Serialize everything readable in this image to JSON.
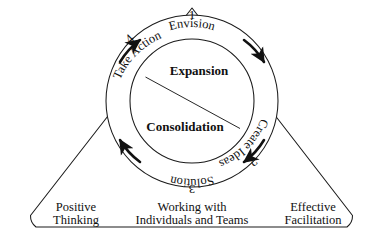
{
  "diagram": {
    "type": "cycle-in-triangle",
    "stroke_color": "#1a1a1a",
    "background": "#ffffff",
    "outer_circle": {
      "cx": 192,
      "cy": 101,
      "r": 86
    },
    "inner_circle": {
      "cx": 192,
      "cy": 101,
      "r": 62
    },
    "triangle": {
      "apex_x": 192,
      "apex_y": 8,
      "left_x": 22,
      "right_x": 361,
      "base_y": 227,
      "corner_radius": 14
    }
  },
  "cycle": {
    "steps": [
      {
        "number": "1",
        "label": "Envision",
        "position": "top",
        "angle": 0
      },
      {
        "number": "2",
        "label": "Create Ideas",
        "position": "right",
        "angle": 90
      },
      {
        "number": "3",
        "label": "Solution",
        "position": "bottom",
        "angle": 180
      },
      {
        "number": "4",
        "label": "Take Action",
        "position": "left",
        "angle": 270
      }
    ],
    "arrows": [
      {
        "name": "arrow-upper-left",
        "direction": "clockwise"
      },
      {
        "name": "arrow-upper-right",
        "direction": "clockwise"
      },
      {
        "name": "arrow-lower-right",
        "direction": "clockwise"
      },
      {
        "name": "arrow-lower-left",
        "direction": "clockwise"
      }
    ]
  },
  "core": {
    "upper": "Expansion",
    "lower": "Consolidation"
  },
  "base": {
    "left": {
      "line1": "Positive",
      "line2": "Thinking"
    },
    "center": {
      "line1": "Working with",
      "line2": "Individuals and Teams"
    },
    "right": {
      "line1": "Effective",
      "line2": "Facilitation"
    }
  }
}
